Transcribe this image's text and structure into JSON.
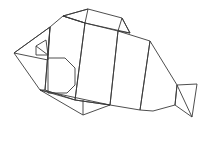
{
  "figure": {
    "colors": {
      "background": "#ffffff",
      "shaded": "#dcdcdc",
      "light": "#ffffff",
      "stroke": "#3a3a3a"
    }
  }
}
